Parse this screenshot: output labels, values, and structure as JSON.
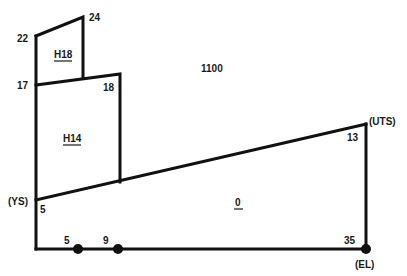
{
  "diagram": {
    "colors": {
      "line": "#111111",
      "text": "#1a1a1a",
      "background": "#ffffff"
    },
    "vertex_labels": {
      "p22": "22",
      "p24": "24",
      "p17": "17",
      "p18": "18",
      "ys": "(YS)",
      "ys_value": "5",
      "uts": "(UTS)",
      "uts_value": "13",
      "bottom_5": "5",
      "bottom_9": "9",
      "bottom_35": "35",
      "el": "(EL)"
    },
    "regions": {
      "h18": "H18",
      "h14": "H14",
      "t1100": "1100",
      "o": "0"
    }
  }
}
